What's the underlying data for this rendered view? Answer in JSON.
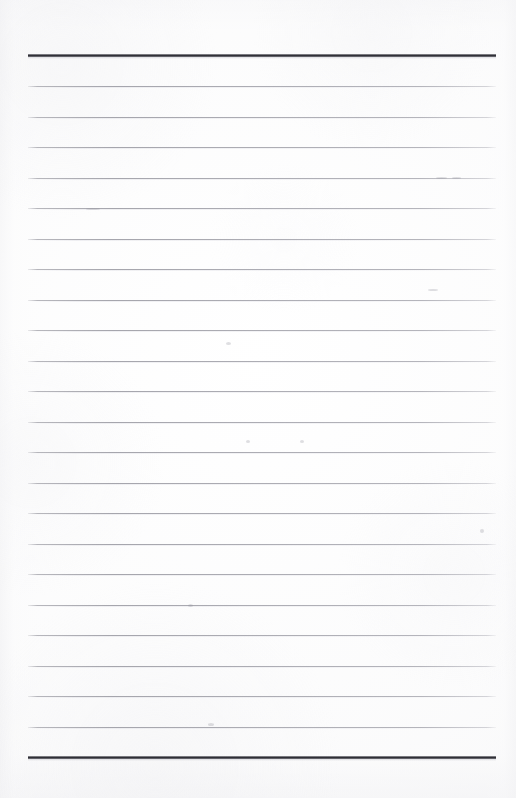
{
  "document": {
    "kind": "scanned-lined-paper",
    "title": "Ruled notebook page (blank)",
    "page_width": 516,
    "page_height": 798,
    "text_content": "",
    "notes": "Blank ruled sheet — no handwriting, no printed text, no headings."
  },
  "colors": {
    "paper": "#fdfdfd",
    "paper_edge_tint": "#eeeef0",
    "rule_thin": "#a2a2aa",
    "rule_heavy": "#2a2a31"
  },
  "ruling": {
    "left_margin_x": 28,
    "right_margin_x": 496,
    "line_length": 468,
    "line_spacing": 30.4,
    "thin_line_count": 23,
    "header_rule_y": 54,
    "footer_rule_y": 756,
    "first_thin_line_y": 86,
    "thin_line_positions": [
      86,
      116.5,
      147,
      177.5,
      208,
      238.5,
      269,
      299.5,
      330,
      360.5,
      391,
      421.5,
      452,
      482.5,
      513,
      543.5,
      574,
      604.5,
      635,
      665.5,
      696,
      726.5,
      757
    ]
  },
  "blemishes": [
    {
      "x": 86,
      "y": 208,
      "w": 14,
      "h": 2
    },
    {
      "x": 436,
      "y": 177,
      "w": 11,
      "h": 2
    },
    {
      "x": 452,
      "y": 177,
      "w": 9,
      "h": 2
    },
    {
      "x": 226,
      "y": 342,
      "w": 5,
      "h": 3
    },
    {
      "x": 428,
      "y": 289,
      "w": 10,
      "h": 2
    },
    {
      "x": 246,
      "y": 440,
      "w": 4,
      "h": 3
    },
    {
      "x": 300,
      "y": 440,
      "w": 4,
      "h": 3
    },
    {
      "x": 480,
      "y": 529,
      "w": 4,
      "h": 4
    },
    {
      "x": 208,
      "y": 723,
      "w": 6,
      "h": 3
    },
    {
      "x": 188,
      "y": 604,
      "w": 5,
      "h": 3
    }
  ]
}
